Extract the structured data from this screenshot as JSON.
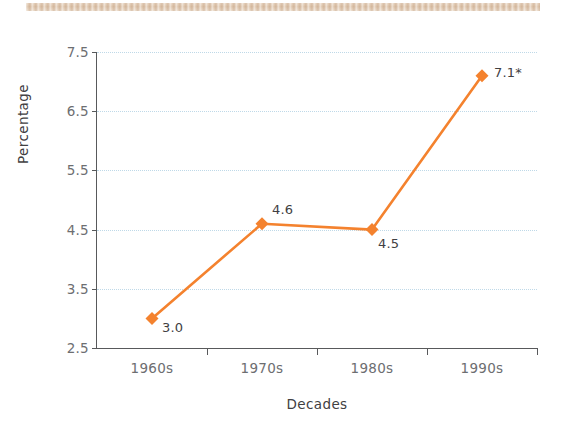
{
  "chart_data": {
    "type": "line",
    "title": "",
    "subtitle": "",
    "xlabel": "Decades",
    "ylabel": "Percentage",
    "categories": [
      "1960s",
      "1970s",
      "1980s",
      "1990s"
    ],
    "values": [
      3.0,
      4.6,
      4.5,
      7.1
    ],
    "point_labels": [
      "3.0",
      "4.6",
      "4.5",
      "7.1*"
    ],
    "series": [
      {
        "name": "Percentage",
        "values": [
          3.0,
          4.6,
          4.5,
          7.1
        ]
      }
    ],
    "ylim": [
      2.5,
      7.5
    ],
    "yticks": [
      2.5,
      3.5,
      4.5,
      5.5,
      6.5,
      7.5
    ],
    "ytick_labels": [
      "2.5",
      "3.5",
      "4.5",
      "5.5",
      "6.5",
      "7.5"
    ],
    "xtick_labels": [
      "1960s",
      "1970s",
      "1980s",
      "1990s"
    ],
    "grid": "horizontal-dotted",
    "legend": "none",
    "annotations": [
      "* asterisk on 1990s value 7.1"
    ]
  },
  "style": {
    "series_color": "#F4822E",
    "grid_color": "#bfd9e8",
    "axis_color": "#58595b",
    "tick_label_color": "#6d6e71",
    "axis_title_color": "#414042",
    "background": "#ffffff",
    "scan_strip_color": "#dcc2a8"
  },
  "labels": {
    "y_axis_title": "Percentage",
    "x_axis_title": "Decades"
  }
}
